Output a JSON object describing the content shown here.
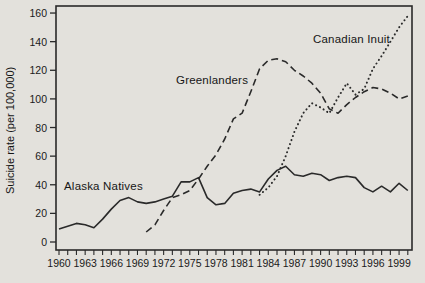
{
  "chart_data": {
    "type": "line",
    "title": "",
    "ylabel": "Suicide rate (per 100,000)",
    "xlabel": "",
    "ylim": [
      0,
      160
    ],
    "yticks": [
      0,
      20,
      40,
      60,
      80,
      100,
      120,
      140,
      160
    ],
    "xlim": [
      1960,
      2001
    ],
    "xticks_labeled": [
      1960,
      1963,
      1966,
      1969,
      1972,
      1975,
      1978,
      1981,
      1984,
      1987,
      1990,
      1993,
      1996,
      1999
    ],
    "xticks_minor_every": 1,
    "xticks_minor_end": 2000,
    "grid": false,
    "legend_position": "inline-annotations",
    "frame": "full-box",
    "colors": {
      "line": "#2a2a2a",
      "text": "#1a1a1a",
      "background": "#e3e1dc"
    },
    "series": [
      {
        "name": "Alaska Natives",
        "style": "solid",
        "x": [
          1960,
          1961,
          1962,
          1963,
          1964,
          1965,
          1966,
          1967,
          1968,
          1969,
          1970,
          1971,
          1972,
          1973,
          1974,
          1975,
          1976,
          1977,
          1978,
          1979,
          1980,
          1981,
          1982,
          1983,
          1984,
          1985,
          1986,
          1987,
          1988,
          1989,
          1990,
          1991,
          1992,
          1993,
          1994,
          1995,
          1996,
          1997,
          1998,
          1999,
          2000
        ],
        "values": [
          9,
          11,
          13,
          12,
          10,
          16,
          23,
          29,
          31,
          28,
          27,
          28,
          30,
          32,
          42,
          42,
          45,
          31,
          26,
          27,
          34,
          36,
          37,
          35,
          44,
          50,
          53,
          47,
          46,
          48,
          47,
          43,
          45,
          46,
          45,
          38,
          35,
          39,
          35,
          41,
          36
        ]
      },
      {
        "name": "Greenlanders",
        "style": "dashed",
        "x": [
          1970,
          1971,
          1972,
          1973,
          1974,
          1975,
          1976,
          1977,
          1978,
          1979,
          1980,
          1981,
          1982,
          1983,
          1984,
          1985,
          1986,
          1987,
          1988,
          1989,
          1990,
          1991,
          1992,
          1993,
          1994,
          1995,
          1996,
          1997,
          1998,
          1999,
          2000
        ],
        "values": [
          7,
          12,
          22,
          31,
          33,
          36,
          44,
          53,
          61,
          72,
          86,
          90,
          105,
          121,
          127,
          128,
          126,
          120,
          116,
          111,
          104,
          93,
          90,
          96,
          101,
          105,
          108,
          107,
          104,
          100,
          102
        ]
      },
      {
        "name": "Canadian Inuit",
        "style": "dotted",
        "x": [
          1983,
          1984,
          1985,
          1986,
          1987,
          1988,
          1989,
          1990,
          1991,
          1992,
          1993,
          1994,
          1995,
          1996,
          1997,
          1998,
          1999,
          2000
        ],
        "values": [
          33,
          38,
          46,
          60,
          77,
          90,
          97,
          94,
          90,
          101,
          111,
          103,
          107,
          121,
          130,
          140,
          150,
          158
        ]
      }
    ]
  }
}
